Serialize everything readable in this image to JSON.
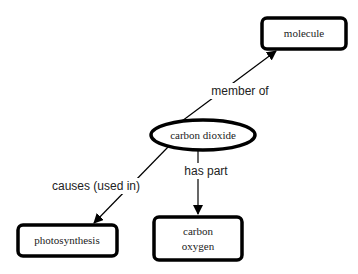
{
  "diagram": {
    "type": "concept-map",
    "nodes": [
      {
        "id": "carbon_dioxide",
        "label": "carbon dioxide",
        "shape": "ellipse"
      },
      {
        "id": "molecule",
        "label": "molecule",
        "shape": "rounded-rect"
      },
      {
        "id": "photosynthesis",
        "label": "photosynthesis",
        "shape": "rounded-rect"
      },
      {
        "id": "carbon_oxygen",
        "label_lines": [
          "carbon",
          "oxygen"
        ],
        "shape": "rounded-rect"
      }
    ],
    "edges": [
      {
        "from": "carbon_dioxide",
        "to": "molecule",
        "label": "member of"
      },
      {
        "from": "carbon_dioxide",
        "to": "carbon_oxygen",
        "label": "has part"
      },
      {
        "from": "carbon_dioxide",
        "to": "photosynthesis",
        "label": "causes (used in)"
      }
    ],
    "colors": {
      "stroke": "#000000",
      "background": "#ffffff",
      "text": "#222222"
    }
  }
}
